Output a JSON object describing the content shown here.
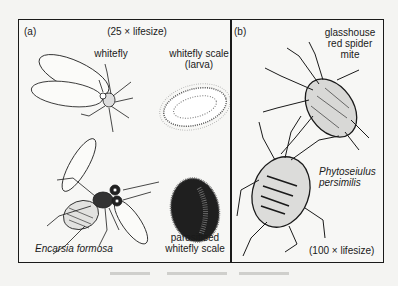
{
  "figure": {
    "panel_a": {
      "label": "(a)",
      "scale": "(25 × lifesize)",
      "items": [
        {
          "name": "whitefly",
          "label": "whitefly"
        },
        {
          "name": "whitefly-scale-larva",
          "label_line1": "whitefly scale",
          "label_line2": "(larva)"
        },
        {
          "name": "encarsia-formosa",
          "label": "Encarsia formosa"
        },
        {
          "name": "parasitised-whitefly-scale",
          "label_line1": "parasitised",
          "label_line2": "whitefly scale"
        }
      ]
    },
    "panel_b": {
      "label": "(b)",
      "scale": "(100 × lifesize)",
      "items": [
        {
          "name": "glasshouse-red-spider-mite",
          "label_line1": "glasshouse",
          "label_line2": "red spider",
          "label_line3": "mite"
        },
        {
          "name": "phytoseiulus-persimilis",
          "label_line1": "Phytoseiulus",
          "label_line2": "persimilis"
        }
      ]
    },
    "footer_bleed": "(faint show-through text, illegible)"
  },
  "colors": {
    "ink": "#1a1a1a",
    "paper": "#f7f7f5",
    "bleed": "#b9b9b6"
  }
}
